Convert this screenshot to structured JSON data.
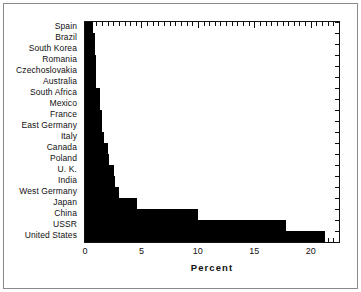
{
  "chart_data": {
    "type": "bar",
    "orientation": "horizontal",
    "title": "",
    "xlabel": "Percent",
    "ylabel": "",
    "xlim": [
      0,
      22.5
    ],
    "xticks": [
      0,
      5,
      10,
      15,
      20
    ],
    "xtick_labels": [
      "0",
      "5",
      "10",
      "15",
      "20"
    ],
    "grid": false,
    "legend": null,
    "bar_color": "#000000",
    "axis_color": "#111111",
    "background_color": "#ffffff",
    "categories": [
      "Spain",
      "Brazil",
      "South Korea",
      "Romania",
      "Czechoslovakia",
      "Australia",
      "South Africa",
      "Mexico",
      "France",
      "East Germany",
      "Italy",
      "Canada",
      "Poland",
      "U. K.",
      "India",
      "West Germany",
      "Japan",
      "China",
      "USSR",
      "United States"
    ],
    "values": [
      0.7,
      0.9,
      0.9,
      1.0,
      1.0,
      1.0,
      1.3,
      1.3,
      1.5,
      1.5,
      1.7,
      2.0,
      2.1,
      2.6,
      2.7,
      3.0,
      4.6,
      10.0,
      17.8,
      21.3
    ]
  },
  "axis": {
    "x_title": "Percent"
  }
}
